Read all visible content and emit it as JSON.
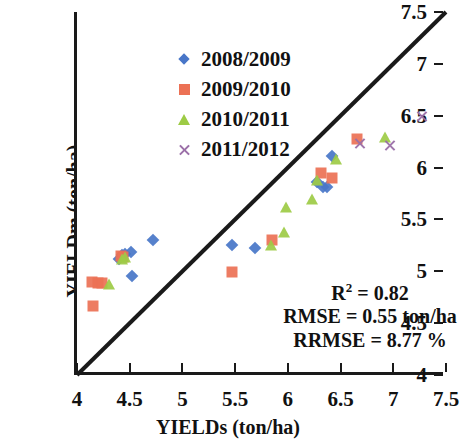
{
  "chart_data": {
    "type": "scatter",
    "title": "",
    "xlabel": "YIELDs (ton/ha)",
    "ylabel": "YIELDm (ton/ha)",
    "xlim": [
      4,
      7.5
    ],
    "ylim": [
      4,
      7.5
    ],
    "xticks": [
      "4",
      "4.5",
      "5",
      "5.5",
      "6",
      "6.5",
      "7",
      "7.5"
    ],
    "yticks": [
      "4",
      "4.5",
      "5",
      "5.5",
      "6",
      "6.5",
      "7",
      "7.5"
    ],
    "xtick_values": [
      4,
      4.5,
      5,
      5.5,
      6,
      6.5,
      7,
      7.5
    ],
    "ytick_values": [
      4,
      4.5,
      5,
      5.5,
      6,
      6.5,
      7,
      7.5
    ],
    "grid": false,
    "legend_position": "top-left",
    "reference_line": {
      "type": "1:1",
      "from": [
        4,
        4
      ],
      "to": [
        7.5,
        7.5
      ],
      "color": "#1a1a1a"
    },
    "series": [
      {
        "name": "2008/2009",
        "marker": "diamond",
        "color": "#4876C8",
        "points": [
          [
            4.4,
            5.12
          ],
          [
            4.43,
            5.16
          ],
          [
            4.46,
            5.17
          ],
          [
            4.51,
            5.19
          ],
          [
            4.52,
            4.95
          ],
          [
            4.72,
            5.3
          ],
          [
            5.47,
            5.25
          ],
          [
            5.69,
            5.22
          ],
          [
            6.28,
            5.86
          ],
          [
            6.33,
            5.81
          ],
          [
            6.37,
            5.81
          ],
          [
            6.42,
            6.11
          ]
        ]
      },
      {
        "name": "2009/2010",
        "marker": "square",
        "color": "#EC7155",
        "points": [
          [
            4.14,
            4.9
          ],
          [
            4.2,
            4.89
          ],
          [
            4.24,
            4.89
          ],
          [
            4.15,
            4.67
          ],
          [
            4.42,
            5.15
          ],
          [
            4.44,
            5.14
          ],
          [
            5.47,
            4.99
          ],
          [
            5.85,
            5.3
          ],
          [
            6.31,
            5.95
          ],
          [
            6.42,
            5.9
          ],
          [
            6.66,
            6.28
          ]
        ]
      },
      {
        "name": "2010/2011",
        "marker": "triangle",
        "color": "#9DCB45",
        "points": [
          [
            4.3,
            4.89
          ],
          [
            4.43,
            5.13
          ],
          [
            4.46,
            5.15
          ],
          [
            5.84,
            5.26
          ],
          [
            5.96,
            5.39
          ],
          [
            5.98,
            5.63
          ],
          [
            6.23,
            5.71
          ],
          [
            6.28,
            5.89
          ],
          [
            6.46,
            6.09
          ],
          [
            6.92,
            6.3
          ]
        ]
      },
      {
        "name": "2011/2012",
        "marker": "cross",
        "color": "#9B6FA8",
        "points": [
          [
            6.68,
            6.24
          ],
          [
            6.97,
            6.22
          ],
          [
            7.27,
            6.5
          ]
        ]
      }
    ],
    "annotations": {
      "r2_label": "R",
      "r2_sup": "2",
      "r2_value": " = 0.82",
      "rmse": "RMSE = 0.55 ton/ha",
      "rrmse": "RRMSE = 8.77 %"
    }
  }
}
